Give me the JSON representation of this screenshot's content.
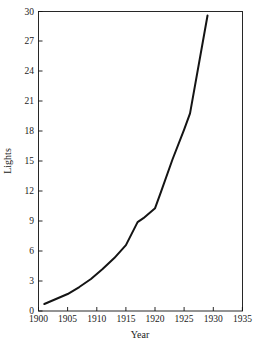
{
  "chart_data": {
    "type": "line",
    "title": "",
    "xlabel": "Year",
    "ylabel": "Lights",
    "xlim": [
      1900,
      1935
    ],
    "ylim": [
      0,
      30
    ],
    "grid": false,
    "legend": null,
    "xticks": [
      1900,
      1905,
      1910,
      1915,
      1920,
      1925,
      1930,
      1935
    ],
    "yticks": [
      0,
      3,
      6,
      9,
      12,
      15,
      18,
      21,
      24,
      27,
      30
    ],
    "series": [
      {
        "name": "Lights",
        "color": "#141414",
        "x": [
          1901,
          1903,
          1905,
          1907,
          1909,
          1911,
          1913,
          1915,
          1917,
          1918,
          1920,
          1921,
          1923,
          1925,
          1926,
          1929
        ],
        "values": [
          0.7,
          1.2,
          1.7,
          2.4,
          3.2,
          4.2,
          5.3,
          6.6,
          8.9,
          9.3,
          10.3,
          11.9,
          15.2,
          18.2,
          19.8,
          29.6
        ]
      }
    ]
  },
  "axes": {
    "x_title": "Year",
    "y_title": "Lights",
    "x_tick_labels": [
      "1900",
      "1905",
      "1910",
      "1915",
      "1920",
      "1925",
      "1930",
      "1935"
    ],
    "y_tick_labels": [
      "0",
      "3",
      "6",
      "9",
      "12",
      "15",
      "18",
      "21",
      "24",
      "27",
      "30"
    ]
  },
  "colors": {
    "line": "#141414",
    "frame": "#111111",
    "background": "#ffffff",
    "text": "#1a1a1a"
  }
}
